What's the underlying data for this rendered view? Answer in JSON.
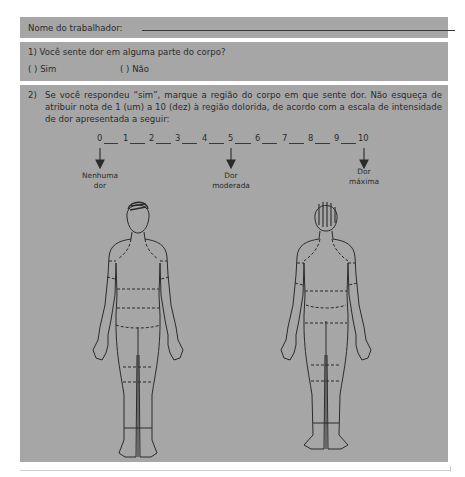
{
  "form": {
    "name_label": "Nome do trabalhador:",
    "name_value": "",
    "q1": {
      "text": "1) Você sente dor em alguma parte do corpo?",
      "options": [
        {
          "label": "(    ) Sim",
          "checked": false
        },
        {
          "label": "(    ) Não",
          "checked": false
        }
      ]
    },
    "q2": {
      "number": "2)",
      "text": "Se você respondeu “sim”, marque a região do corpo em que sente dor. Não esqueça de atribuir nota de 1 (um) a 10 (dez) à região dolorida, de acordo com a escala de intensidade de dor apresentada a seguir:",
      "scale": {
        "ticks": [
          "0",
          "1",
          "2",
          "3",
          "4",
          "5",
          "6",
          "7",
          "8",
          "9",
          "10"
        ],
        "anchors": [
          {
            "at": "0",
            "label_line1": "Nenhuma",
            "label_line2": "dor"
          },
          {
            "at": "5",
            "label_line1": "Dor",
            "label_line2": "moderada"
          },
          {
            "at": "10",
            "label_line1": "Dor",
            "label_line2": "máxima"
          }
        ]
      },
      "diagrams": [
        {
          "view": "front",
          "name": "body-front-diagram"
        },
        {
          "view": "back",
          "name": "body-back-diagram"
        }
      ]
    }
  },
  "colors": {
    "box_bg": "#a6a6a6",
    "text": "#2b2b2b",
    "line": "#3a3a3a"
  }
}
